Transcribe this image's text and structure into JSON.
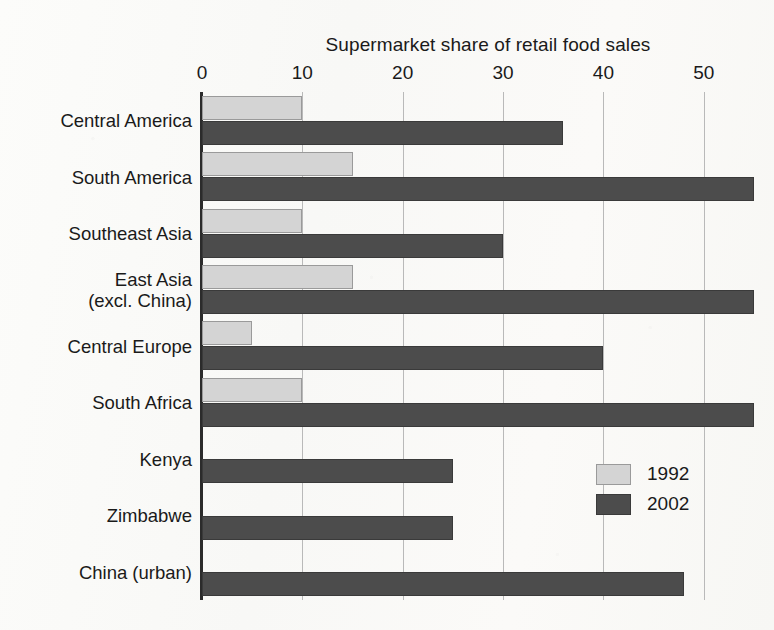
{
  "chart_data": {
    "type": "bar",
    "orientation": "horizontal",
    "title": "Supermarket share of retail food sales",
    "xlabel": "",
    "ylabel": "",
    "xlim": [
      0,
      57
    ],
    "xticks": [
      0,
      10,
      20,
      30,
      40,
      50
    ],
    "xtick_labels": [
      "0",
      "10",
      "20",
      "30",
      "40",
      "50"
    ],
    "grid": "vertical",
    "legend_position": "bottom-right-inside",
    "categories": [
      "Central America",
      "South America",
      "Southeast Asia",
      "East Asia\n(excl. China)",
      "Central Europe",
      "South Africa",
      "Kenya",
      "Zimbabwe",
      "China (urban)"
    ],
    "series": [
      {
        "name": "1992",
        "color": "#d4d4d4",
        "values": [
          10,
          15,
          10,
          15,
          5,
          10,
          0,
          0,
          0
        ]
      },
      {
        "name": "2002",
        "color": "#4c4c4c",
        "values": [
          36,
          55,
          30,
          55,
          40,
          55,
          25,
          25,
          48
        ]
      }
    ]
  },
  "legend": {
    "entries": [
      {
        "label": "1992",
        "series": "s1992"
      },
      {
        "label": "2002",
        "series": "s2002"
      }
    ]
  }
}
